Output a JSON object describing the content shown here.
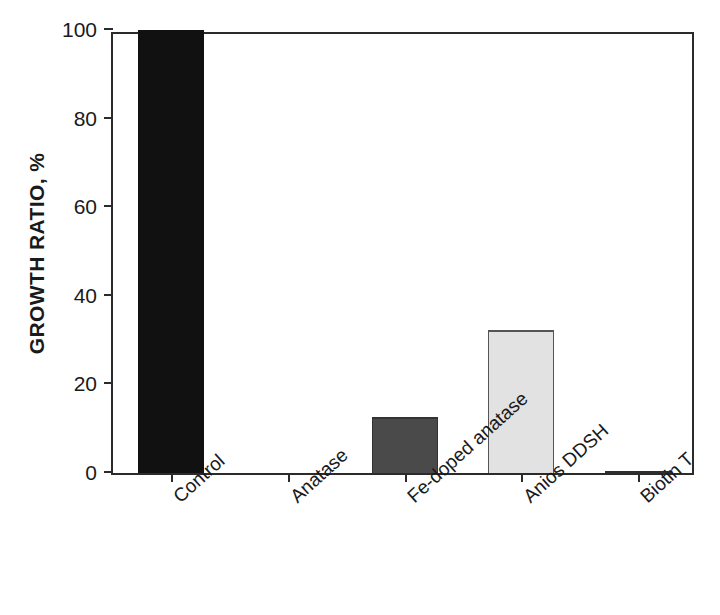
{
  "chart_data": {
    "type": "bar",
    "title": "",
    "subtitle": "",
    "xlabel": "",
    "ylabel": "GROWTH RATIO, %",
    "categories": [
      "Control",
      "Anatase",
      "Fe-doped anatase",
      "Anios DDSH",
      "Biotin T"
    ],
    "values": [
      100,
      0,
      12.6,
      32.3,
      0.5
    ],
    "series": [
      {
        "name": "Growth ratio",
        "values": [
          100,
          0,
          12.6,
          32.3,
          0.5
        ]
      }
    ],
    "bar_styles": [
      {
        "category": "Control",
        "fill": "#111111",
        "border": "#111111"
      },
      {
        "category": "Anatase",
        "fill": "#111111",
        "border": "#111111"
      },
      {
        "category": "Fe-doped anatase",
        "fill": "#4a4a4a",
        "border": "#333333"
      },
      {
        "category": "Anios DDSH",
        "fill": "#e2e2e2",
        "border": "#555555"
      },
      {
        "category": "Biotin T",
        "fill": "#2e2e2e",
        "border": "#2e2e2e"
      }
    ],
    "ylim": [
      0,
      100
    ],
    "ytick_values": [
      0,
      20,
      40,
      60,
      80,
      100
    ],
    "ytick_labels": [
      "0",
      "20",
      "40",
      "60",
      "80",
      "100"
    ],
    "grid": false,
    "legend": null,
    "legend_position": "none",
    "axis_color": "#2b2b2b",
    "background": "#ffffff",
    "frame": "box",
    "tick_direction": "out",
    "xtick_label_rotation": -42
  }
}
